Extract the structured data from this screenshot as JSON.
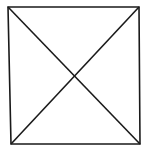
{
  "diagram": {
    "type": "square-with-diagonals",
    "stroke_color": "#1a1a1a",
    "background_color": "#ffffff",
    "stroke_width": 1.6,
    "vertices": {
      "top_left": [
        8,
        7
      ],
      "top_right": [
        139,
        7
      ],
      "bottom_right": [
        140,
        144
      ],
      "bottom_left": [
        11,
        144
      ]
    },
    "diagonals": [
      {
        "from": "top_left",
        "to": "bottom_right"
      },
      {
        "from": "top_right",
        "to": "bottom_left"
      }
    ],
    "intersection": [
      75,
      76
    ]
  }
}
